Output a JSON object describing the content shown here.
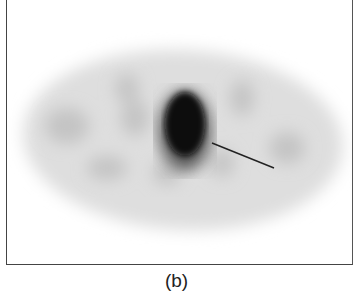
{
  "figure": {
    "caption": "(b)",
    "colors": {
      "background": "#ffffff",
      "frame": "#444444",
      "body_tone": "#d8d8d8",
      "hotspot": "#0a0a0a",
      "pointer": "#222222"
    }
  }
}
